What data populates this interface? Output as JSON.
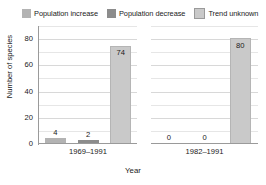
{
  "chart_data": {
    "type": "bar",
    "title": "",
    "xlabel": "Year",
    "ylabel": "Number of species",
    "ylim": [
      0,
      90
    ],
    "yticks": [
      0,
      20,
      40,
      60,
      80
    ],
    "ytick_labels": [
      "0",
      "20",
      "40",
      "60",
      "80"
    ],
    "minor_gridlines": true,
    "grid": true,
    "legend_position": "top",
    "categories": [
      "1969–1991",
      "1982–1991"
    ],
    "series": [
      {
        "name": "Population increase",
        "color": "#b3b3b3",
        "values": [
          4,
          0
        ],
        "labels": [
          "4",
          "0"
        ]
      },
      {
        "name": "Population decrease",
        "color": "#8c8c8c",
        "values": [
          2,
          0
        ],
        "labels": [
          "2",
          "0"
        ]
      },
      {
        "name": "Trend unknown",
        "color": "#c9c9c9",
        "values": [
          74,
          80
        ],
        "labels": [
          "74",
          "80"
        ]
      }
    ]
  },
  "legend": {
    "items": [
      {
        "label": "Population increase",
        "color": "#b3b3b3"
      },
      {
        "label": "Population decrease",
        "color": "#8c8c8c"
      },
      {
        "label": "Trend unknown",
        "color": "#c9c9c9"
      }
    ]
  },
  "axes": {
    "y_title": "Number of species",
    "x_title": "Year",
    "y_ticks": [
      "0",
      "20",
      "40",
      "60",
      "80"
    ],
    "x_ticks": [
      "1969–1991",
      "1982–1991"
    ]
  },
  "panels": [
    {
      "x_label": "1969–1991",
      "bars": [
        {
          "series": "Population increase",
          "value": 4,
          "label": "4",
          "label_pos": "outside",
          "color": "#b3b3b3"
        },
        {
          "series": "Population decrease",
          "value": 2,
          "label": "2",
          "label_pos": "outside",
          "color": "#8c8c8c"
        },
        {
          "series": "Trend unknown",
          "value": 74,
          "label": "74",
          "label_pos": "inside",
          "color": "#c9c9c9"
        }
      ]
    },
    {
      "x_label": "1982–1991",
      "bars": [
        {
          "series": "Population increase",
          "value": 0,
          "label": "0",
          "label_pos": "outside",
          "color": "#b3b3b3"
        },
        {
          "series": "Population decrease",
          "value": 0,
          "label": "0",
          "label_pos": "outside",
          "color": "#8c8c8c"
        },
        {
          "series": "Trend unknown",
          "value": 80,
          "label": "80",
          "label_pos": "inside",
          "color": "#c9c9c9"
        }
      ]
    }
  ],
  "colors": {
    "gridline": "#d8d8d8",
    "gridline_minor": "#e6e6e6",
    "axis": "#9a9a9a",
    "background": "#ffffff",
    "text": "#1a1a1a"
  }
}
